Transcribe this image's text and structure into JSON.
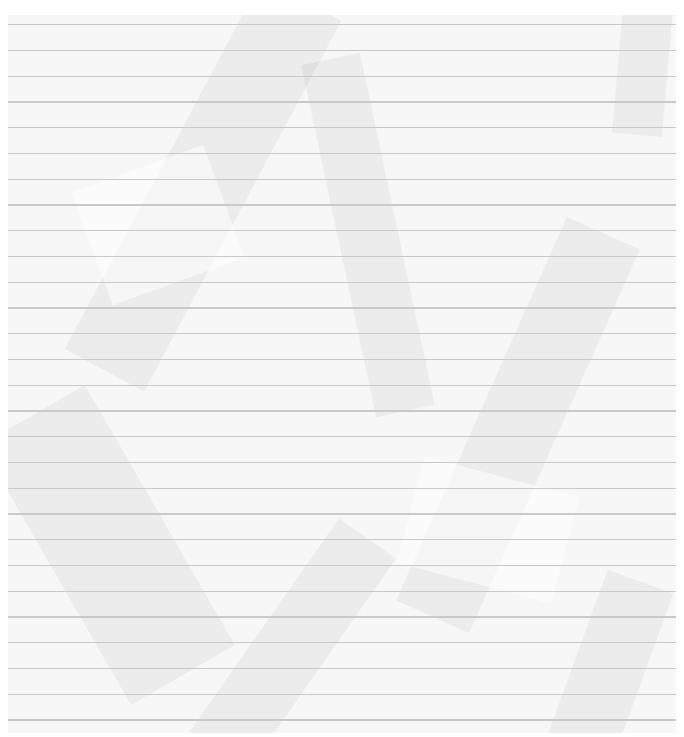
{
  "image": {
    "subject": "crumpled ruled notebook paper",
    "background_color": "#ffffff",
    "paper_color": "#f7f7f7",
    "rule_color": "#c9c9c9",
    "paper_bounds": {
      "left": 8,
      "top": 15,
      "right": 676,
      "bottom": 733
    },
    "rule_lines": {
      "count": 28,
      "first_y": 24,
      "spacing": 25.75
    },
    "creases": [
      {
        "x": 150,
        "y": -40,
        "w": 90,
        "h": 420,
        "rot": 28,
        "tone": "dark"
      },
      {
        "x": 330,
        "y": 40,
        "w": 60,
        "h": 360,
        "rot": -12,
        "tone": "dark"
      },
      {
        "x": 470,
        "y": 200,
        "w": 80,
        "h": 420,
        "rot": 24,
        "tone": "dark"
      },
      {
        "x": 40,
        "y": 380,
        "w": 120,
        "h": 300,
        "rot": -30,
        "tone": "dark"
      },
      {
        "x": 610,
        "y": -20,
        "w": 50,
        "h": 140,
        "rot": 5,
        "tone": "dark"
      },
      {
        "x": 250,
        "y": 500,
        "w": 70,
        "h": 260,
        "rot": 35,
        "tone": "dark"
      },
      {
        "x": 560,
        "y": 560,
        "w": 70,
        "h": 220,
        "rot": 20,
        "tone": "dark"
      },
      {
        "x": 80,
        "y": 150,
        "w": 140,
        "h": 120,
        "rot": -20,
        "tone": "light"
      },
      {
        "x": 400,
        "y": 460,
        "w": 160,
        "h": 110,
        "rot": 15,
        "tone": "light"
      }
    ]
  }
}
